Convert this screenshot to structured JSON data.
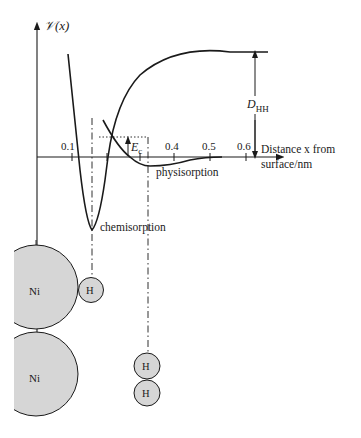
{
  "figure": {
    "y_axis_label": "𝒱(x)",
    "x_axis_label_line1": "Distance x from",
    "x_axis_label_line2": "surface/nm",
    "x_ticks": [
      "0.1",
      "0.4",
      "0.5",
      "0.6"
    ],
    "curve_labels": {
      "chemisorption": "chemisorption",
      "physisorption": "physisorption"
    },
    "annotations": {
      "activation_energy": "E",
      "activation_energy_sub": "c",
      "dissociation_energy": "D",
      "dissociation_energy_sub": "HH"
    },
    "atoms": {
      "nickel_top": "Ni",
      "nickel_bottom": "Ni",
      "hydrogen_adsorbed": "H",
      "hydrogen_molecule_top": "H",
      "hydrogen_molecule_bottom": "H"
    },
    "colors": {
      "ink": "#1a1a1a",
      "atom_fill": "#d6d6d6"
    }
  }
}
